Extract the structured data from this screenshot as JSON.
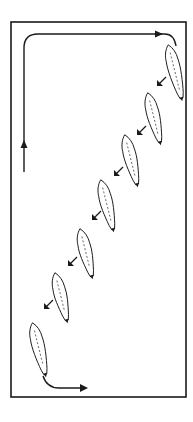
{
  "diagram": {
    "type": "riding-arena-figure",
    "colors": {
      "ink": "#1a1a1a",
      "background": "#ffffff",
      "body_fill": "#ffffff"
    },
    "arena": {
      "x": 11,
      "y": 22,
      "width": 175,
      "height": 375
    },
    "track": {
      "left_up_arrow": {
        "x": 24,
        "y_from": 172,
        "y_to": 40
      },
      "top_line": {
        "x_from": 24,
        "x_to": 165,
        "y": 34
      }
    },
    "horses": [
      {
        "cx": 175,
        "cy": 72,
        "len": 56
      },
      {
        "cx": 154,
        "cy": 118,
        "len": 52
      },
      {
        "cx": 131,
        "cy": 160,
        "len": 52
      },
      {
        "cx": 107,
        "cy": 205,
        "len": 52
      },
      {
        "cx": 86,
        "cy": 253,
        "len": 50
      },
      {
        "cx": 61,
        "cy": 297,
        "len": 50
      },
      {
        "cx": 39,
        "cy": 349,
        "len": 54
      }
    ],
    "direction_arrows": [
      {
        "x": 161,
        "y": 82
      },
      {
        "x": 141,
        "y": 131
      },
      {
        "x": 118,
        "y": 172
      },
      {
        "x": 96,
        "y": 216
      },
      {
        "x": 72,
        "y": 262
      },
      {
        "x": 48,
        "y": 305
      }
    ],
    "exit_arrow": {
      "x_from": 43,
      "y_from": 376,
      "x_to": 88,
      "y_to": 388
    }
  }
}
